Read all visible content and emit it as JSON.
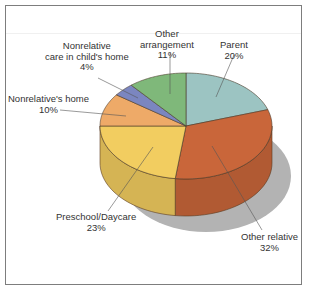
{
  "chart_data": {
    "type": "pie",
    "style": "3d",
    "title": "",
    "slices": [
      {
        "label": "Parent",
        "value": 20,
        "display": "20%",
        "color": "#9cc4c2"
      },
      {
        "label": "Other relative",
        "value": 32,
        "display": "32%",
        "color": "#c9663a"
      },
      {
        "label": "Preschool/Daycare",
        "value": 23,
        "display": "23%",
        "color": "#f2cd60"
      },
      {
        "label": "Nonrelative's home",
        "value": 10,
        "display": "10%",
        "color": "#eeaa68"
      },
      {
        "label": "Nonrelative care in child's home",
        "value": 4,
        "display": "4%",
        "color": "#7b86c0"
      },
      {
        "label": "Other arrangement",
        "value": 11,
        "display": "11%",
        "color": "#7fb87a"
      }
    ],
    "start_angle": "12 o'clock",
    "direction": "clockwise",
    "legend": "none (direct labels with leader lines)"
  },
  "labels": {
    "parent": {
      "line1": "Parent",
      "pct": "20%"
    },
    "other_relative": {
      "line1": "Other relative",
      "pct": "32%"
    },
    "preschool": {
      "line1": "Preschool/Daycare",
      "pct": "23%"
    },
    "nonrel_home": {
      "line1": "Nonrelative's home",
      "pct": "10%"
    },
    "nonrel_care": {
      "line1": "Nonrelative",
      "line2": "care in child's home",
      "pct": "4%"
    },
    "other_arr": {
      "line1": "Other",
      "line2": "arrangement",
      "pct": "11%"
    }
  }
}
